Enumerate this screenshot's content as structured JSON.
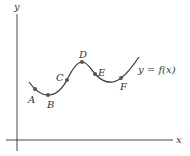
{
  "diagram": {
    "axes": {
      "x_label": "x",
      "y_label": "y",
      "color": "#444444"
    },
    "curve": {
      "label": "y = f(x)",
      "color": "#333333"
    },
    "points": [
      {
        "name": "A",
        "x": 35,
        "y": 89,
        "label_x": 28,
        "label_y": 103
      },
      {
        "name": "B",
        "x": 48,
        "y": 95,
        "label_x": 47,
        "label_y": 108
      },
      {
        "name": "C",
        "x": 67,
        "y": 79,
        "label_x": 56,
        "label_y": 81
      },
      {
        "name": "D",
        "x": 82,
        "y": 64,
        "label_x": 79,
        "label_y": 60
      },
      {
        "name": "E",
        "x": 95,
        "y": 73,
        "label_x": 98,
        "label_y": 76
      },
      {
        "name": "F",
        "x": 121,
        "y": 77,
        "label_x": 120,
        "label_y": 90
      }
    ],
    "point_color": "#555555"
  }
}
